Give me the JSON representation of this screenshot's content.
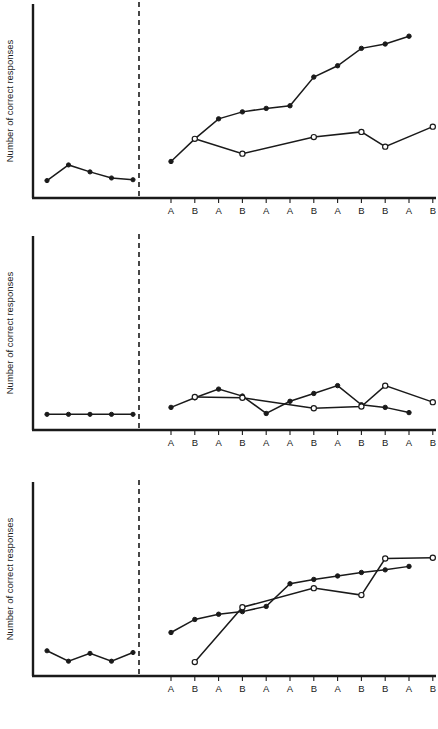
{
  "figure": {
    "background": "#ffffff",
    "ink_color": "#1a1a1a",
    "panel_count": 3
  },
  "chart_data": {
    "type": "line",
    "title": "",
    "xlabel": "",
    "ylabel": "Number of correct responses",
    "grid": false,
    "legend_position": "none",
    "phase_divider_label": "",
    "baseline_tick_labels": [
      "",
      "",
      "",
      "",
      ""
    ],
    "treatment_tick_labels": [
      "A",
      "B",
      "A",
      "B",
      "A",
      "A",
      "B",
      "A",
      "B",
      "B",
      "A",
      "B"
    ],
    "ylim": [
      0,
      10
    ],
    "panels": [
      {
        "name": "panel-1",
        "ylabel": "Number of correct responses",
        "baseline": {
          "marker": "filled",
          "x": [
            1,
            2,
            3,
            4,
            5
          ],
          "values": [
            1.0,
            1.9,
            1.5,
            1.15,
            1.05
          ]
        },
        "treatment_series": [
          {
            "name": "filled-series",
            "marker": "filled",
            "x": [
              1,
              2,
              3,
              4,
              5,
              6,
              7,
              8,
              9,
              10,
              11,
              12
            ],
            "values": [
              2.1,
              3.4,
              4.55,
              4.95,
              5.15,
              5.3,
              6.95,
              7.6,
              8.6,
              8.85,
              9.3,
              null
            ]
          },
          {
            "name": "open-series",
            "marker": "open",
            "x": [
              1,
              2,
              3,
              4,
              5,
              6,
              7,
              8,
              9,
              10,
              11,
              12
            ],
            "values": [
              null,
              3.4,
              null,
              2.55,
              null,
              null,
              3.5,
              null,
              3.8,
              2.95,
              null,
              4.1
            ]
          }
        ]
      },
      {
        "name": "panel-2",
        "ylabel": "Number of correct responses",
        "baseline": {
          "marker": "filled",
          "x": [
            1,
            2,
            3,
            4,
            5
          ],
          "values": [
            0.9,
            0.9,
            0.9,
            0.9,
            0.9
          ]
        },
        "treatment_series": [
          {
            "name": "filled-series",
            "marker": "filled",
            "x": [
              1,
              2,
              3,
              4,
              5,
              6,
              7,
              8,
              9,
              10,
              11,
              12
            ],
            "values": [
              1.3,
              1.85,
              2.35,
              1.95,
              0.95,
              1.65,
              2.1,
              2.55,
              1.45,
              1.3,
              1.0,
              null
            ]
          },
          {
            "name": "open-series",
            "marker": "open",
            "x": [
              1,
              2,
              3,
              4,
              5,
              6,
              7,
              8,
              9,
              10,
              11,
              12
            ],
            "values": [
              null,
              1.9,
              null,
              1.85,
              null,
              null,
              1.25,
              null,
              1.35,
              2.55,
              null,
              1.6
            ]
          }
        ]
      },
      {
        "name": "panel-3",
        "ylabel": "Number of correct responses",
        "baseline": {
          "marker": "filled",
          "x": [
            1,
            2,
            3,
            4,
            5
          ],
          "values": [
            1.45,
            0.85,
            1.3,
            0.85,
            1.35
          ]
        },
        "treatment_series": [
          {
            "name": "filled-series",
            "marker": "filled",
            "x": [
              1,
              2,
              3,
              4,
              5,
              6,
              7,
              8,
              9,
              10,
              11,
              12
            ],
            "values": [
              2.5,
              3.25,
              3.55,
              3.7,
              4.0,
              5.3,
              5.55,
              5.75,
              5.95,
              6.1,
              6.3,
              null
            ]
          },
          {
            "name": "open-series",
            "marker": "open",
            "x": [
              1,
              2,
              3,
              4,
              5,
              6,
              7,
              8,
              9,
              10,
              11,
              12
            ],
            "values": [
              null,
              0.8,
              null,
              3.95,
              null,
              null,
              5.05,
              null,
              4.65,
              6.75,
              null,
              6.8
            ]
          }
        ]
      }
    ]
  }
}
